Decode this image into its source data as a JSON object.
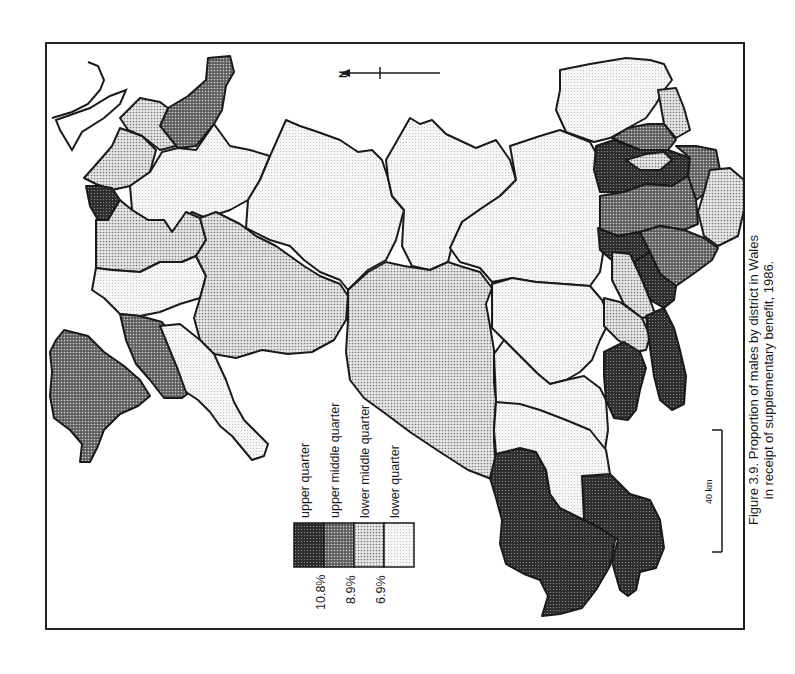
{
  "figure": {
    "caption_line1": "Figure 3.9.  Proportion of males by district in Wales",
    "caption_line2": "in receipt of supplementary benefit, 1986.",
    "orientation": "rotated 90° counter-clockwise",
    "north_arrow": {
      "label": "N",
      "icon": "north-arrow-icon"
    },
    "scale_bar": {
      "label": "40 km"
    }
  },
  "legend": {
    "items": [
      {
        "label": "upper quarter",
        "fill": "#3a3a3a",
        "pattern": "dense-dots"
      },
      {
        "label": "upper middle quarter",
        "fill": "#777777",
        "pattern": "medium-dots"
      },
      {
        "label": "lower middle quarter",
        "fill": "#b4b4b4",
        "pattern": "light-dots"
      },
      {
        "label": "lower quarter",
        "fill": "#ececec",
        "pattern": "sparse-dots"
      }
    ],
    "breaks": [
      "10.8%",
      "8.9%",
      "6.9%"
    ]
  },
  "colors": {
    "upper_quarter": "#3a3a3a",
    "upper_middle_quarter": "#777777",
    "lower_middle_quarter": "#b4b4b4",
    "lower_quarter": "#ececec",
    "outline": "#1a1a1a",
    "background": "#ffffff"
  }
}
